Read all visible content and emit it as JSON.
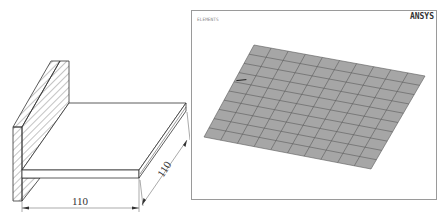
{
  "drawing": {
    "title": "T-joint plate isometric drawing",
    "dimension_width": "110",
    "dimension_depth": "110",
    "line_color": "#333333",
    "hatch_color": "#555555"
  },
  "ansys_view": {
    "brand_label": "ANSYS",
    "plot_label": "ELEMENTS",
    "mesh": {
      "rows": 10,
      "cols": 10,
      "fill_color": "#a6a6a6",
      "line_color": "#5a5a5a",
      "corners": {
        "top_left": [
          62,
          34
        ],
        "top_right": [
          233,
          65
        ],
        "bottom_right": [
          179,
          158
        ],
        "bottom_left": [
          12,
          126
        ]
      }
    },
    "border_color": "#9a9a9a"
  }
}
